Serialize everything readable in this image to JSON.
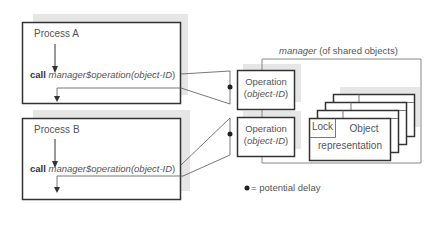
{
  "process_a": {
    "title": "Process A",
    "call_keyword": "call",
    "call_target": "manager$operation(",
    "call_arg": "object-ID",
    "call_close": ")"
  },
  "process_b": {
    "title": "Process B",
    "call_keyword": "call",
    "call_target": "manager$operation(",
    "call_arg": "object-ID",
    "call_close": ")"
  },
  "manager": {
    "title_italic": "manager",
    "title_rest": " (of shared objects)",
    "operations": [
      {
        "label": "Operation",
        "open": "(",
        "arg": "object-ID",
        "close": ")"
      },
      {
        "label": "Operation",
        "open": "(",
        "arg": "object-ID",
        "close": ")"
      }
    ],
    "object_stack": {
      "lock_label": "Lock",
      "object_label_line1": "Object",
      "object_label_line2": "representation",
      "stack_depth": 4
    }
  },
  "legend": {
    "symbol": "●",
    "text": " = potential delay"
  },
  "colors": {
    "line": "#333333",
    "thin_line": "#777777",
    "shadow": "#e4e4e4"
  }
}
